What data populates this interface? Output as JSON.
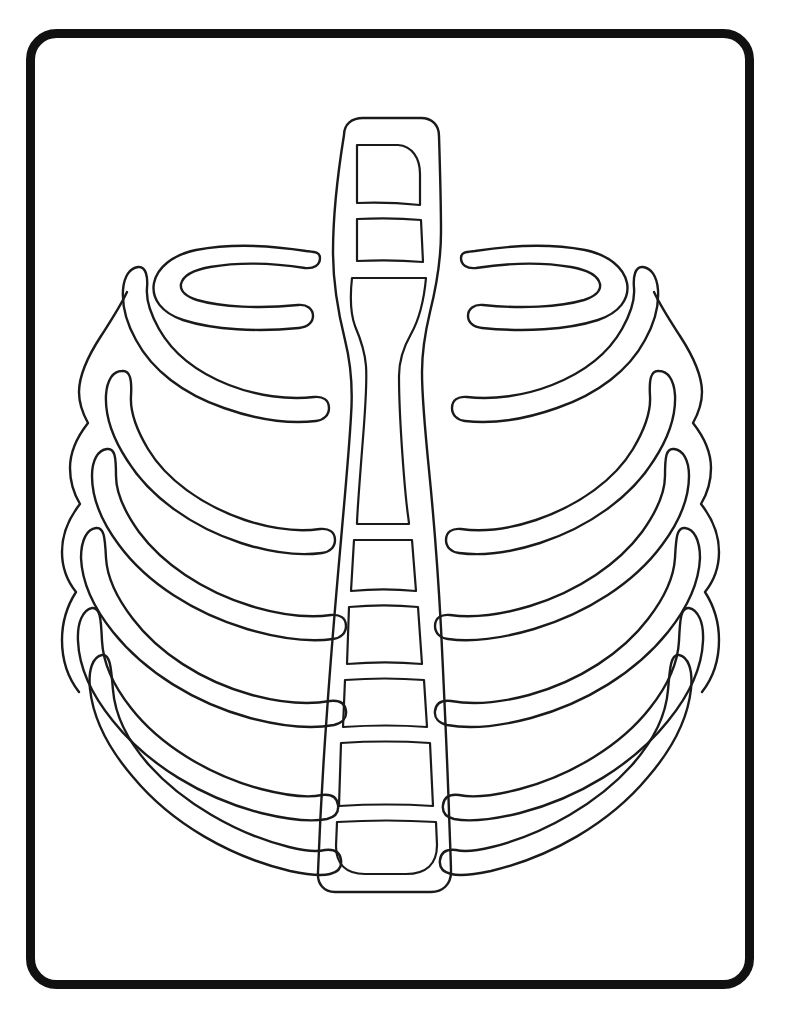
{
  "page": {
    "background_color": "#ffffff",
    "ink_color": "#1a1a1a",
    "width": 791,
    "height": 1021
  },
  "frame": {
    "name": "rounded-rectangle-border",
    "x": 26,
    "y": 29,
    "width": 728,
    "height": 960,
    "corner_radius": 26,
    "stroke_width": 9,
    "color": "#111111"
  },
  "artwork": {
    "subject": "human rib cage",
    "style": "line-art outline, coloring book",
    "description": "Front view of a human rib cage with a segmented sternum column in the center and curved ribs fanning out to the left and right.",
    "parts": [
      {
        "name": "sternum-column",
        "label": "Sternum / spine column",
        "segments": 8
      },
      {
        "name": "left-rib-group",
        "label": "Left ribs",
        "count": 8
      },
      {
        "name": "right-rib-group",
        "label": "Right ribs",
        "count": 8
      },
      {
        "name": "left-outer-contour",
        "label": "Left outer rib contour"
      },
      {
        "name": "right-outer-contour",
        "label": "Right outer rib contour"
      }
    ]
  },
  "sternum": {
    "outline_top_y": 118,
    "outline_bottom_y": 893,
    "segment_labels": [
      "manubrium-upper",
      "manubrium-lower",
      "body-waist",
      "segment-3",
      "segment-4",
      "segment-5",
      "segment-6",
      "xiphoid-lower"
    ]
  },
  "chart_data": null
}
